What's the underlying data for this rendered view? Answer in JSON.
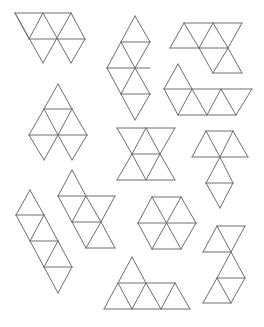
{
  "caption": "",
  "stroke_color": "#6e6e6e",
  "nets": [
    {
      "name": "net-top-left-trapezoid",
      "segs": [
        [
          15,
          13,
          71,
          13
        ],
        [
          29,
          39,
          85,
          39
        ],
        [
          15,
          13,
          43,
          63
        ],
        [
          43,
          13,
          71,
          63
        ],
        [
          71,
          13,
          85,
          39
        ],
        [
          43,
          13,
          29,
          39
        ],
        [
          71,
          13,
          43,
          63
        ],
        [
          85,
          39,
          71,
          63
        ],
        [
          15,
          13,
          29,
          39
        ]
      ]
    },
    {
      "name": "net-vertical-zigzag",
      "segs": [
        [
          135,
          16,
          150,
          42
        ],
        [
          135,
          16,
          121,
          42
        ],
        [
          121,
          42,
          150,
          42
        ],
        [
          121,
          42,
          107,
          68
        ],
        [
          150,
          42,
          135,
          68
        ],
        [
          121,
          42,
          135,
          68
        ],
        [
          107,
          68,
          150,
          68
        ],
        [
          107,
          68,
          121,
          94
        ],
        [
          135,
          68,
          121,
          94
        ],
        [
          135,
          68,
          150,
          94
        ],
        [
          121,
          94,
          150,
          94
        ],
        [
          121,
          94,
          135,
          120
        ],
        [
          150,
          94,
          135,
          120
        ]
      ]
    },
    {
      "name": "net-top-right-parallelogram",
      "segs": [
        [
          184,
          23,
          242,
          23
        ],
        [
          170,
          48,
          228,
          48
        ],
        [
          184,
          23,
          170,
          48
        ],
        [
          184,
          23,
          199,
          48
        ],
        [
          213,
          23,
          199,
          48
        ],
        [
          213,
          23,
          228,
          48
        ],
        [
          242,
          23,
          228,
          48
        ],
        [
          228,
          48,
          213,
          73
        ],
        [
          228,
          48,
          242,
          73
        ],
        [
          213,
          73,
          242,
          73
        ],
        [
          199,
          48,
          213,
          73
        ]
      ]
    },
    {
      "name": "net-right-long-strip",
      "segs": [
        [
          178,
          64,
          164,
          89
        ],
        [
          178,
          64,
          192,
          89
        ],
        [
          164,
          89,
          252,
          89
        ],
        [
          164,
          89,
          178,
          115
        ],
        [
          192,
          89,
          178,
          115
        ],
        [
          192,
          89,
          207,
          115
        ],
        [
          221,
          89,
          207,
          115
        ],
        [
          221,
          89,
          236,
          115
        ],
        [
          252,
          89,
          236,
          115
        ],
        [
          178,
          115,
          236,
          115
        ]
      ]
    },
    {
      "name": "net-left-diamond",
      "segs": [
        [
          58,
          84,
          44,
          109
        ],
        [
          58,
          84,
          72,
          109
        ],
        [
          44,
          109,
          72,
          109
        ],
        [
          44,
          109,
          29,
          135
        ],
        [
          44,
          109,
          58,
          135
        ],
        [
          72,
          109,
          58,
          135
        ],
        [
          72,
          109,
          87,
          135
        ],
        [
          29,
          135,
          87,
          135
        ],
        [
          29,
          135,
          44,
          160
        ],
        [
          58,
          135,
          44,
          160
        ],
        [
          58,
          135,
          72,
          160
        ],
        [
          87,
          135,
          72,
          160
        ]
      ]
    },
    {
      "name": "net-center-hourglass",
      "segs": [
        [
          117,
          128,
          175,
          128
        ],
        [
          117,
          128,
          132,
          154
        ],
        [
          146,
          128,
          132,
          154
        ],
        [
          146,
          128,
          160,
          154
        ],
        [
          175,
          128,
          160,
          154
        ],
        [
          132,
          154,
          160,
          154
        ],
        [
          132,
          154,
          117,
          180
        ],
        [
          132,
          154,
          146,
          180
        ],
        [
          160,
          154,
          146,
          180
        ],
        [
          160,
          154,
          175,
          180
        ],
        [
          117,
          180,
          175,
          180
        ]
      ]
    },
    {
      "name": "net-right-hook",
      "segs": [
        [
          206,
          131,
          233,
          131
        ],
        [
          206,
          131,
          192,
          157
        ],
        [
          206,
          131,
          220,
          157
        ],
        [
          233,
          131,
          220,
          157
        ],
        [
          233,
          131,
          248,
          157
        ],
        [
          192,
          157,
          248,
          157
        ],
        [
          220,
          157,
          206,
          183
        ],
        [
          220,
          157,
          233,
          183
        ],
        [
          206,
          183,
          233,
          183
        ],
        [
          206,
          183,
          220,
          208
        ],
        [
          233,
          183,
          220,
          208
        ]
      ]
    },
    {
      "name": "net-left-diagonal-strip",
      "segs": [
        [
          30,
          190,
          16,
          215
        ],
        [
          30,
          190,
          44,
          215
        ],
        [
          16,
          215,
          44,
          215
        ],
        [
          16,
          215,
          30,
          241
        ],
        [
          44,
          215,
          30,
          241
        ],
        [
          44,
          215,
          58,
          241
        ],
        [
          30,
          241,
          58,
          241
        ],
        [
          30,
          241,
          44,
          267
        ],
        [
          58,
          241,
          44,
          267
        ],
        [
          58,
          241,
          72,
          267
        ],
        [
          44,
          267,
          72,
          267
        ],
        [
          44,
          267,
          58,
          293
        ],
        [
          72,
          267,
          58,
          293
        ]
      ]
    },
    {
      "name": "net-center-left-zigzag",
      "segs": [
        [
          72,
          170,
          58,
          196
        ],
        [
          72,
          170,
          86,
          196
        ],
        [
          58,
          196,
          115,
          196
        ],
        [
          58,
          196,
          72,
          222
        ],
        [
          86,
          196,
          72,
          222
        ],
        [
          86,
          196,
          101,
          222
        ],
        [
          115,
          196,
          101,
          222
        ],
        [
          72,
          222,
          101,
          222
        ],
        [
          72,
          222,
          86,
          248
        ],
        [
          101,
          222,
          86,
          248
        ],
        [
          101,
          222,
          115,
          248
        ],
        [
          86,
          248,
          115,
          248
        ]
      ]
    },
    {
      "name": "net-hexagon",
      "segs": [
        [
          152,
          197,
          181,
          197
        ],
        [
          152,
          197,
          138,
          223
        ],
        [
          181,
          197,
          196,
          223
        ],
        [
          138,
          223,
          196,
          223
        ],
        [
          138,
          223,
          152,
          249
        ],
        [
          196,
          223,
          181,
          249
        ],
        [
          152,
          249,
          181,
          249
        ],
        [
          152,
          197,
          181,
          249
        ],
        [
          181,
          197,
          152,
          249
        ]
      ]
    },
    {
      "name": "net-bottom-right-zigzag",
      "segs": [
        [
          217,
          226,
          245,
          226
        ],
        [
          217,
          226,
          203,
          252
        ],
        [
          217,
          226,
          231,
          252
        ],
        [
          245,
          226,
          231,
          252
        ],
        [
          203,
          252,
          231,
          252
        ],
        [
          231,
          252,
          217,
          278
        ],
        [
          231,
          252,
          245,
          278
        ],
        [
          217,
          278,
          245,
          278
        ],
        [
          217,
          278,
          203,
          303
        ],
        [
          217,
          278,
          231,
          303
        ],
        [
          245,
          278,
          231,
          303
        ],
        [
          203,
          303,
          231,
          303
        ]
      ]
    },
    {
      "name": "net-bottom-pyramid-strip",
      "segs": [
        [
          132,
          257,
          118,
          283
        ],
        [
          132,
          257,
          146,
          283
        ],
        [
          118,
          283,
          175,
          283
        ],
        [
          118,
          283,
          104,
          309
        ],
        [
          118,
          283,
          132,
          309
        ],
        [
          146,
          283,
          132,
          309
        ],
        [
          146,
          283,
          161,
          309
        ],
        [
          175,
          283,
          161,
          309
        ],
        [
          175,
          283,
          190,
          309
        ],
        [
          104,
          309,
          190,
          309
        ]
      ]
    }
  ]
}
